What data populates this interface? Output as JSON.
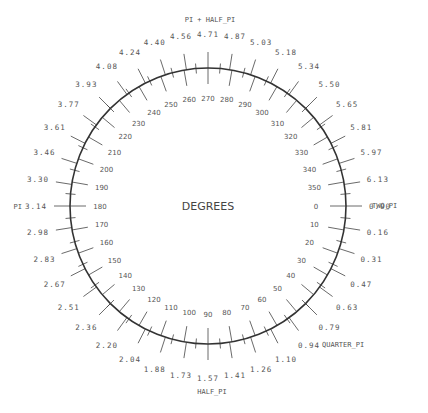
{
  "diagram": {
    "title": "DEGREES",
    "center": [
      208,
      206
    ],
    "radius": 138,
    "colors": {
      "circle": "#333333",
      "ticks": "#444444",
      "text": "#555555"
    },
    "degree_labels": [
      "0",
      "10",
      "20",
      "30",
      "40",
      "50",
      "60",
      "70",
      "80",
      "90",
      "100",
      "110",
      "120",
      "130",
      "140",
      "150",
      "160",
      "170",
      "180",
      "190",
      "200",
      "210",
      "220",
      "230",
      "240",
      "250",
      "260",
      "270",
      "280",
      "290",
      "300",
      "310",
      "320",
      "330",
      "340",
      "350"
    ],
    "radian_labels": [
      "0.00",
      "0.16",
      "0.31",
      "0.47",
      "0.63",
      "0.79",
      "0.94",
      "1.10",
      "1.26",
      "1.41",
      "1.57",
      "1.73",
      "1.88",
      "2.04",
      "2.20",
      "2.36",
      "2.51",
      "2.67",
      "2.83",
      "2.98",
      "3.14",
      "3.30",
      "3.46",
      "3.61",
      "3.77",
      "3.93",
      "4.08",
      "4.24",
      "4.40",
      "4.56",
      "4.71",
      "4.87",
      "5.03",
      "5.18",
      "5.34",
      "5.50",
      "5.65",
      "5.81",
      "5.97",
      "6.13"
    ],
    "named_labels": [
      {
        "text": "TWO_PI",
        "angle_deg": 0,
        "x": 372,
        "y": 208,
        "anchor": "start"
      },
      {
        "text": "QUARTER_PI",
        "angle_deg": 45,
        "x": 322,
        "y": 347,
        "anchor": "start"
      },
      {
        "text": "HALF_PI",
        "angle_deg": 90,
        "x": 212,
        "y": 394,
        "anchor": "middle"
      },
      {
        "text": "PI",
        "angle_deg": 180,
        "x": 22,
        "y": 209,
        "anchor": "end"
      },
      {
        "text": "PI + HALF_PI",
        "angle_deg": 270,
        "x": 210,
        "y": 22,
        "anchor": "middle"
      }
    ]
  }
}
